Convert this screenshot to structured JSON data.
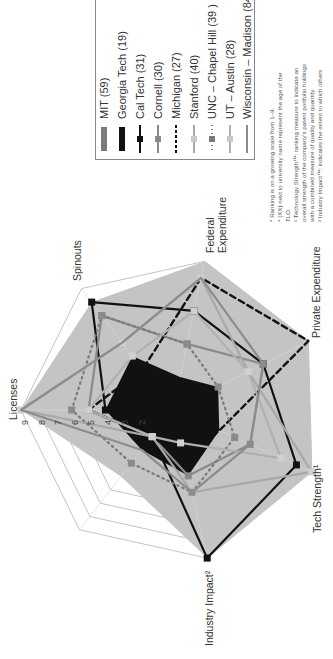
{
  "chart_data": {
    "type": "radar",
    "orientation": "rotated 90° counter-clockwise",
    "axes": [
      "Licenses",
      "Spinouts",
      "Federal Expenditure",
      "Private Expenditure",
      "Tech Strength¹",
      "Industry Impact²",
      ""
    ],
    "scale": {
      "min": 0,
      "max": 9,
      "ticks": [
        1,
        2,
        3,
        4,
        5,
        6,
        7,
        8,
        9
      ]
    },
    "series": [
      {
        "name": "MIT (59)",
        "style": "filled area, grey",
        "values": [
          9,
          8,
          9,
          9,
          9,
          9,
          5
        ]
      },
      {
        "name": "Georgia Tech (19)",
        "style": "filled area, black",
        "values": [
          4,
          4,
          2,
          3,
          3,
          4,
          3
        ]
      },
      {
        "name": "Cal Tech (31)",
        "style": "black line, square markers",
        "values": [
          4,
          8,
          6,
          6,
          8,
          9,
          2
        ]
      },
      {
        "name": "Cornell (30)",
        "style": "grey line, square markers",
        "values": [
          5,
          7,
          4,
          6,
          5,
          4,
          2
        ]
      },
      {
        "name": "Michigan (27)",
        "style": "black dashed line",
        "values": [
          5,
          3,
          8,
          9,
          3,
          3,
          2
        ]
      },
      {
        "name": "Stanford (40)",
        "style": "light grey line, square markers",
        "values": [
          9,
          5,
          8,
          5,
          9,
          5,
          2
        ]
      },
      {
        "name": "UNC – Chapel Hill (39 )",
        "style": "grey dotted line, square markers",
        "values": [
          6,
          7,
          4,
          3,
          4,
          5,
          4
        ]
      },
      {
        "name": "UT – Austin (28)",
        "style": "light grey line, square markers",
        "values": [
          5,
          4,
          6,
          5,
          7,
          2,
          2
        ]
      },
      {
        "name": "Wisconsin – Madison (84)",
        "style": "grey line, no markers",
        "values": [
          9,
          5,
          8,
          6,
          5,
          5,
          3
        ]
      }
    ],
    "legend_position": "top-right (rotated)",
    "grid": true
  },
  "axes_labels": {
    "licenses": "Licenses",
    "spinouts": "Spinouts",
    "federal_1": "Federal",
    "federal_2": "Expenditure",
    "private": "Private Expenditure",
    "tech": "Tech Strength¹",
    "industry": "Industry Impact²"
  },
  "ticks": [
    "9",
    "8",
    "7",
    "6",
    "5",
    "4",
    "3",
    "2"
  ],
  "legend": [
    {
      "label": "MIT (59)"
    },
    {
      "label": "Georgia Tech (19)"
    },
    {
      "label": "Cal Tech (31)"
    },
    {
      "label": "Cornell (30)"
    },
    {
      "label": "Michigan (27)"
    },
    {
      "label": "Stanford (40)"
    },
    {
      "label": "UNC – Chapel Hill (39 )"
    },
    {
      "label": "UT – Austin (28)"
    },
    {
      "label": "Wisconsin – Madison (84)"
    }
  ],
  "footnotes": [
    "* Ranking is on a growing scale from 1–9.",
    "* (XX) next to university name represent the age of the",
    "  TLO.",
    "¹ Technology Strength™: ranking measure to indicate an",
    "  overall strength of the company's patent portfolio holdings",
    "  with a combined measure of quality and quantity.",
    "² Industry Impact™: indicates the extent to which others"
  ],
  "colors": {
    "mit": "#bdbdbd",
    "georgia_tech": "#111111",
    "cal_tech": "#111111",
    "cornell": "#8a8a8a",
    "michigan": "#111111",
    "stanford": "#a8a8a8",
    "unc": "#7a7a7a",
    "ut": "#b0b0b0",
    "wisconsin": "#8c8c8c",
    "grid": "#9a9a9a"
  }
}
